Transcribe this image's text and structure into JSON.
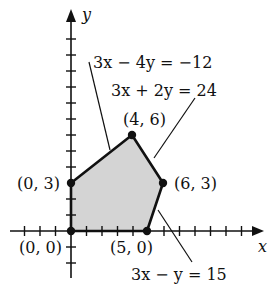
{
  "diagram": {
    "axes": {
      "x_label": "x",
      "y_label": "y"
    },
    "vertices": [
      {
        "label": "(0, 0)",
        "x": 0,
        "y": 0
      },
      {
        "label": "(5, 0)",
        "x": 5,
        "y": 0
      },
      {
        "label": "(6, 3)",
        "x": 6,
        "y": 3
      },
      {
        "label": "(4, 6)",
        "x": 4,
        "y": 6
      },
      {
        "label": "(0, 3)",
        "x": 0,
        "y": 3
      }
    ],
    "constraint_lines": [
      {
        "label": "3x − 4y = −12"
      },
      {
        "label": "3x + 2y = 24"
      },
      {
        "label": "3x − y = 15"
      }
    ],
    "region_fill": "#d4d4d4",
    "line_color": "#111111"
  }
}
